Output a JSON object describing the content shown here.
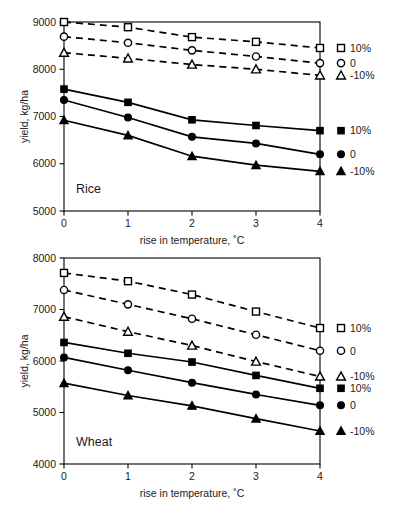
{
  "figure": {
    "background": "#ffffff",
    "ink_color": "#000000"
  },
  "chart_data": [
    {
      "type": "line",
      "title": "Rice",
      "panel_label": "Rice",
      "xlabel": "rise in temperature, ˚C",
      "ylabel": "yield, kg/ha",
      "x": [
        0,
        1,
        2,
        3,
        4
      ],
      "xticklabels": [
        "0",
        "1",
        "2",
        "3",
        "4"
      ],
      "xlim": [
        0,
        4
      ],
      "ylim": [
        5000,
        9000
      ],
      "yticks": [
        5000,
        6000,
        7000,
        8000,
        9000
      ],
      "yticklabels": [
        "5000",
        "6000",
        "7000",
        "8000",
        "9000"
      ],
      "grid": false,
      "legend_position": "right-inside",
      "series": [
        {
          "name": "10%",
          "style": "dashed",
          "marker": "square-open",
          "legend_label": "10%",
          "values": [
            9000,
            8890,
            8680,
            8580,
            8450
          ]
        },
        {
          "name": "0",
          "style": "dashed",
          "marker": "circle-open",
          "legend_label": "0",
          "values": [
            8690,
            8560,
            8400,
            8270,
            8130
          ]
        },
        {
          "name": "-10%",
          "style": "dashed",
          "marker": "triangle-open",
          "legend_label": "-10%",
          "values": [
            8350,
            8230,
            8100,
            8000,
            7870
          ]
        },
        {
          "name": "10%",
          "style": "solid",
          "marker": "square-filled",
          "legend_label": "10%",
          "values": [
            7580,
            7300,
            6930,
            6810,
            6700
          ]
        },
        {
          "name": "0",
          "style": "solid",
          "marker": "circle-filled",
          "legend_label": "0",
          "values": [
            7350,
            6980,
            6570,
            6430,
            6200
          ]
        },
        {
          "name": "-10%",
          "style": "solid",
          "marker": "triangle-filled",
          "legend_label": "-10%",
          "values": [
            6920,
            6600,
            6160,
            5970,
            5840
          ]
        }
      ]
    },
    {
      "type": "line",
      "title": "Wheat",
      "panel_label": "Wheat",
      "xlabel": "rise in temperature, ˚C",
      "ylabel": "yield, kg/ha",
      "x": [
        0,
        1,
        2,
        3,
        4
      ],
      "xticklabels": [
        "0",
        "1",
        "2",
        "3",
        "4"
      ],
      "xlim": [
        0,
        4
      ],
      "ylim": [
        4000,
        8000
      ],
      "yticks": [
        4000,
        5000,
        6000,
        7000,
        8000
      ],
      "yticklabels": [
        "4000",
        "5000",
        "6000",
        "7000",
        "8000"
      ],
      "grid": false,
      "legend_position": "right-inside",
      "series": [
        {
          "name": "10%",
          "style": "dashed",
          "marker": "square-open",
          "legend_label": "10%",
          "values": [
            7710,
            7550,
            7290,
            6960,
            6640
          ]
        },
        {
          "name": "0",
          "style": "dashed",
          "marker": "circle-open",
          "legend_label": "0",
          "values": [
            7380,
            7100,
            6820,
            6510,
            6200
          ]
        },
        {
          "name": "-10%",
          "style": "dashed",
          "marker": "triangle-open",
          "legend_label": "-10%",
          "values": [
            6860,
            6570,
            6300,
            5990,
            5700
          ]
        },
        {
          "name": "10%",
          "style": "solid",
          "marker": "square-filled",
          "legend_label": "10%",
          "values": [
            6360,
            6150,
            5980,
            5720,
            5470
          ]
        },
        {
          "name": "0",
          "style": "solid",
          "marker": "circle-filled",
          "legend_label": "0",
          "values": [
            6070,
            5820,
            5580,
            5350,
            5140
          ]
        },
        {
          "name": "-10%",
          "style": "solid",
          "marker": "triangle-filled",
          "legend_label": "-10%",
          "values": [
            5570,
            5330,
            5130,
            4880,
            4640
          ]
        }
      ]
    }
  ]
}
